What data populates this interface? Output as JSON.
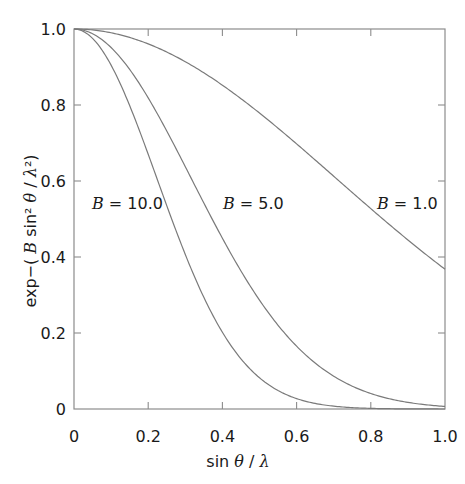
{
  "chart_data": {
    "type": "line",
    "title": "",
    "xlabel": "sin θ/λ",
    "ylabel": "exp−(B sin² θ/λ²)",
    "xlim": [
      0,
      1.0
    ],
    "ylim": [
      0,
      1.0
    ],
    "grid": false,
    "x_ticks": [
      "0",
      "0.2",
      "0.4",
      "0.6",
      "0.8",
      "1.0"
    ],
    "y_ticks": [
      "0",
      "0.2",
      "0.4",
      "0.6",
      "0.8",
      "1.0"
    ],
    "legend": "inline annotations",
    "x": [
      0,
      0.1,
      0.2,
      0.3,
      0.4,
      0.5,
      0.6,
      0.7,
      0.8,
      0.9,
      1.0
    ],
    "series": [
      {
        "name": "B = 10.0",
        "B": 10.0,
        "values": [
          1.0,
          0.905,
          0.67,
          0.407,
          0.202,
          0.082,
          0.027,
          0.007,
          0.002,
          0.0003,
          5e-05
        ]
      },
      {
        "name": "B = 5.0",
        "B": 5.0,
        "values": [
          1.0,
          0.951,
          0.819,
          0.638,
          0.449,
          0.287,
          0.165,
          0.086,
          0.041,
          0.017,
          0.007
        ]
      },
      {
        "name": "B = 1.0",
        "B": 1.0,
        "values": [
          1.0,
          0.99,
          0.961,
          0.914,
          0.852,
          0.779,
          0.698,
          0.613,
          0.527,
          0.445,
          0.368
        ]
      }
    ],
    "annotations": [
      {
        "text_var": "B",
        "text_rest": " = 10.0",
        "x_px": 92,
        "y_px": 209
      },
      {
        "text_var": "B",
        "text_rest": " = 5.0",
        "x_px": 223,
        "y_px": 209
      },
      {
        "text_var": "B",
        "text_rest": " = 1.0",
        "x_px": 377,
        "y_px": 209
      }
    ]
  },
  "colors": {
    "axis": "#8c8c8c",
    "curve": "#7a7a7a",
    "text": "#1a1a1a"
  }
}
